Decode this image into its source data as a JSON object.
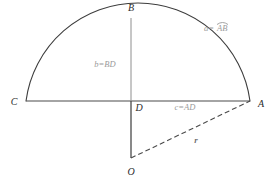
{
  "figure": {
    "type": "geometry-diagram",
    "shape": "circular-segment",
    "background_color": "#ffffff"
  },
  "colors": {
    "arc_stroke": "#3d3d3d",
    "chord_stroke": "#4a4a4a",
    "height_stroke": "#8e8e8e",
    "radius_stroke": "#4a4a4a",
    "vertex_label": "#2b2b2b",
    "measure_label": "#9a9a9a",
    "radius_label": "#6f6f6f"
  },
  "vertices": [
    {
      "id": "B",
      "label": "B",
      "x": 131,
      "y": 18,
      "label_x": 131,
      "label_y": 11
    },
    {
      "id": "C",
      "label": "C",
      "x": 26,
      "y": 101,
      "label_x": 14,
      "label_y": 105
    },
    {
      "id": "A",
      "label": "A",
      "x": 250,
      "y": 101,
      "label_x": 261,
      "label_y": 107
    },
    {
      "id": "D",
      "label": "D",
      "x": 131,
      "y": 101,
      "label_x": 139,
      "label_y": 111
    },
    {
      "id": "O",
      "label": "O",
      "x": 131,
      "y": 158,
      "label_x": 131,
      "label_y": 175
    }
  ],
  "measures": [
    {
      "id": "a",
      "text": "a=",
      "operand": "AB",
      "accent": "arc",
      "description": "arc from A to B",
      "x": 213,
      "y": 31
    },
    {
      "id": "b",
      "text": "b=BD",
      "description": "segment height from B to D",
      "x": 105,
      "y": 67
    },
    {
      "id": "c",
      "text": "c=AD",
      "description": "half chord from A to D",
      "x": 185,
      "y": 110
    },
    {
      "id": "r",
      "text": "r",
      "description": "radius from O to A",
      "x": 196,
      "y": 143
    }
  ],
  "segments": [
    {
      "id": "chord-CA",
      "from": "C",
      "to": "A",
      "style": "solid",
      "color": "#4a4a4a"
    },
    {
      "id": "height-BD",
      "from": "B",
      "to": "D",
      "style": "solid",
      "color": "#8e8e8e"
    },
    {
      "id": "apothem-DO",
      "from": "D",
      "to": "O",
      "style": "solid",
      "color": "#4a4a4a"
    },
    {
      "id": "radius-OA",
      "from": "O",
      "to": "A",
      "style": "dashed",
      "color": "#4a4a4a"
    }
  ],
  "arc": {
    "id": "arc-CBA",
    "from": "C",
    "through": "B",
    "to": "A",
    "style": "solid",
    "color": "#3d3d3d"
  }
}
